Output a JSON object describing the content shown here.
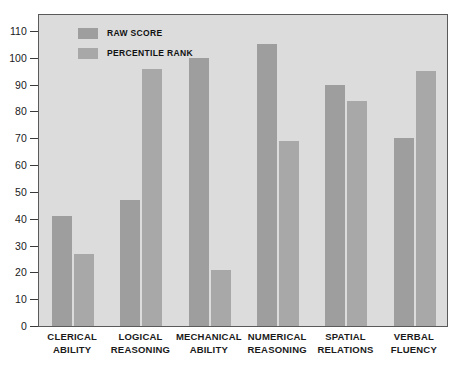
{
  "chart_data": {
    "type": "bar",
    "title": "",
    "xlabel": "",
    "ylabel": "",
    "ylim": [
      0,
      110
    ],
    "ytick_step": 10,
    "grid": false,
    "legend_position": "top-left",
    "categories": [
      "CLERICAL ABILITY",
      "LOGICAL REASONING",
      "MECHANICAL ABILITY",
      "NUMERICAL REASONING",
      "SPATIAL RELATIONS",
      "VERBAL FLUENCY"
    ],
    "category_lines": [
      [
        "CLERICAL",
        "ABILITY"
      ],
      [
        "LOGICAL",
        "REASONING"
      ],
      [
        "MECHANICAL",
        "ABILITY"
      ],
      [
        "NUMERICAL",
        "REASONING"
      ],
      [
        "SPATIAL",
        "RELATIONS"
      ],
      [
        "VERBAL",
        "FLUENCY"
      ]
    ],
    "series": [
      {
        "name": "RAW SCORE",
        "color": "#9e9e9e",
        "values": [
          41,
          47,
          100,
          105,
          90,
          70
        ]
      },
      {
        "name": "PERCENTILE RANK",
        "color": "#a8a8a8",
        "values": [
          27,
          96,
          21,
          69,
          84,
          95
        ]
      }
    ],
    "ytick_labels": [
      "0",
      "10",
      "20",
      "30",
      "40",
      "50",
      "60",
      "70",
      "80",
      "90",
      "100",
      "110"
    ],
    "ytick_values": [
      0,
      10,
      20,
      30,
      40,
      50,
      60,
      70,
      80,
      90,
      100,
      110
    ]
  },
  "legend": {
    "items": [
      {
        "label": "RAW SCORE",
        "color": "#9e9e9e"
      },
      {
        "label": "PERCENTILE RANK",
        "color": "#a8a8a8"
      }
    ]
  },
  "colors": {
    "plot_background": "#dcdcdc",
    "page_background": "#ffffff",
    "axis": "#3a3a3a",
    "frame": "#5a5a5a",
    "raw_score": "#9e9e9e",
    "percentile_rank": "#a8a8a8",
    "text": "#1a1a1a"
  }
}
